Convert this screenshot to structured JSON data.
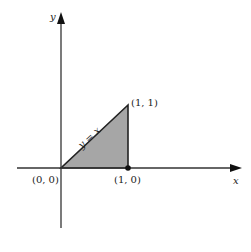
{
  "diagram": {
    "axes": {
      "x_label": "x",
      "y_label": "y"
    },
    "line_label": "y = x",
    "points": [
      {
        "label": "(0, 0)",
        "x": 0,
        "y": 0
      },
      {
        "label": "(1, 0)",
        "x": 1,
        "y": 0
      },
      {
        "label": "(1, 1)",
        "x": 1,
        "y": 1
      }
    ],
    "region": {
      "description": "Shaded triangle bounded by y = x, x = 1, and y = 0",
      "fill": "#a6a6a6",
      "vertices": [
        [
          0,
          0
        ],
        [
          1,
          0
        ],
        [
          1,
          1
        ]
      ]
    },
    "colors": {
      "axis": "#333333",
      "outline": "#222222",
      "dot": "#111111"
    }
  }
}
